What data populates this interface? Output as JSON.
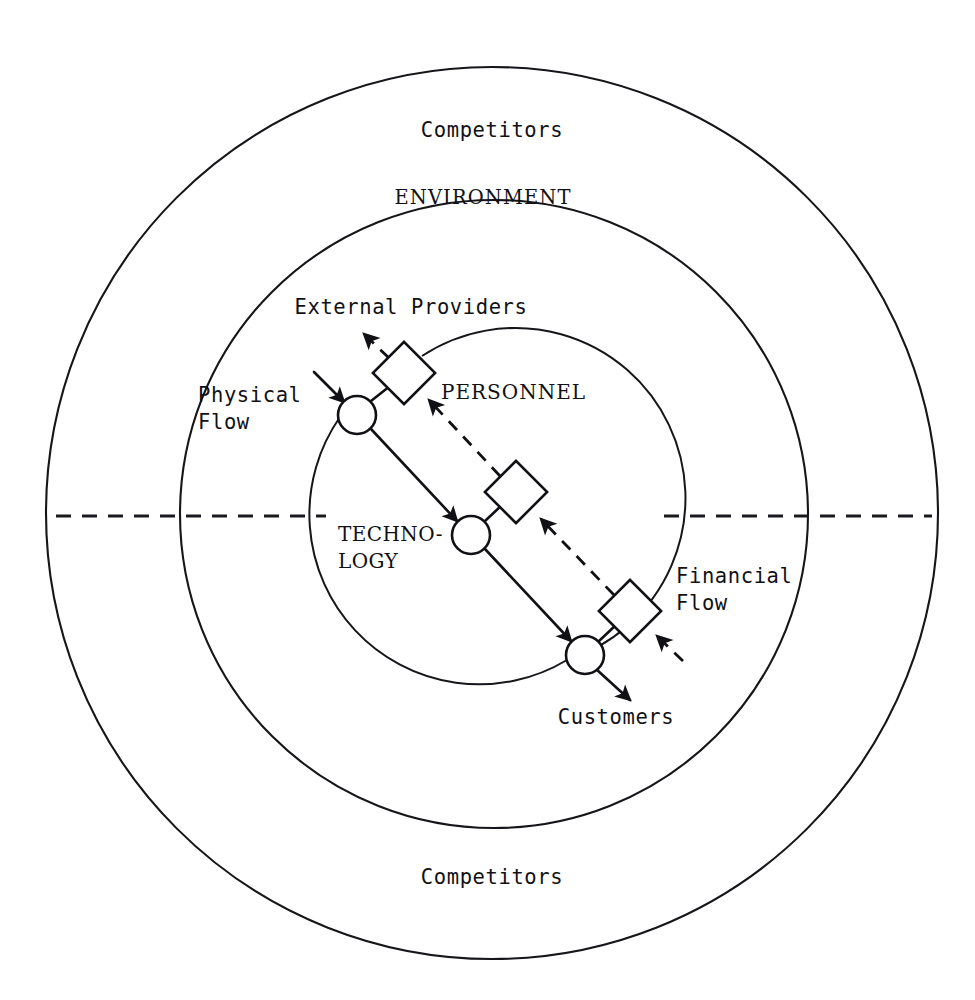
{
  "diagram": {
    "type": "concentric-systems-diagram",
    "background_color": "#ffffff",
    "line_color": "#111115",
    "rings": [
      {
        "id": "outer-ring",
        "label": "Competitors",
        "label_top": "Competitors",
        "label_bottom": "Competitors",
        "center": [
          492,
          513
        ],
        "radius": 446
      },
      {
        "id": "middle-ring",
        "label": "ENVIRONMENT",
        "center": [
          494,
          514
        ],
        "radius": 314
      },
      {
        "id": "inner-ring",
        "label": "TECHNO-LOGY",
        "center": [
          495,
          515
        ],
        "radius": 170
      }
    ],
    "ring_labels": {
      "competitors_top": "Competitors",
      "environment": "ENVIRONMENT",
      "competitors_bottom": "Competitors"
    },
    "inner_labels": {
      "technology_line1": "TECHNO-",
      "technology_line2": "LOGY",
      "personnel": "PERSONNEL"
    },
    "flow_labels": {
      "external_providers": "External Providers",
      "physical_flow_line1": "Physical",
      "physical_flow_line2": "Flow",
      "financial_flow_line1": "Financial",
      "financial_flow_line2": "Flow",
      "customers": "Customers"
    },
    "nodes": [
      {
        "id": "circle-1",
        "shape": "circle",
        "cx": 357,
        "cy": 415,
        "r": 19
      },
      {
        "id": "square-1",
        "shape": "square",
        "cx": 404,
        "cy": 373,
        "size": 44,
        "rotation": 45
      },
      {
        "id": "circle-2",
        "shape": "circle",
        "cx": 471,
        "cy": 535,
        "r": 19
      },
      {
        "id": "square-2",
        "shape": "square",
        "cx": 516,
        "cy": 492,
        "size": 44,
        "rotation": 45
      },
      {
        "id": "circle-3",
        "shape": "circle",
        "cx": 585,
        "cy": 655,
        "r": 19
      },
      {
        "id": "square-3",
        "shape": "square",
        "cx": 630,
        "cy": 611,
        "size": 44,
        "rotation": 45
      }
    ],
    "flows": [
      {
        "id": "physical-flow",
        "style": "solid",
        "direction": "top-left to bottom-right",
        "label": "Physical Flow",
        "entry_arrow": true,
        "exit_arrow": true
      },
      {
        "id": "financial-flow",
        "style": "dashed",
        "direction": "bottom-right to top-left",
        "label": "Financial Flow",
        "entry_arrow": true,
        "exit_arrow": true
      }
    ],
    "axis_line": {
      "id": "horizontal-dashed-axis",
      "style": "dashed",
      "y": 516,
      "left_segment": [
        56,
        326
      ],
      "right_segment": [
        664,
        932
      ]
    }
  }
}
